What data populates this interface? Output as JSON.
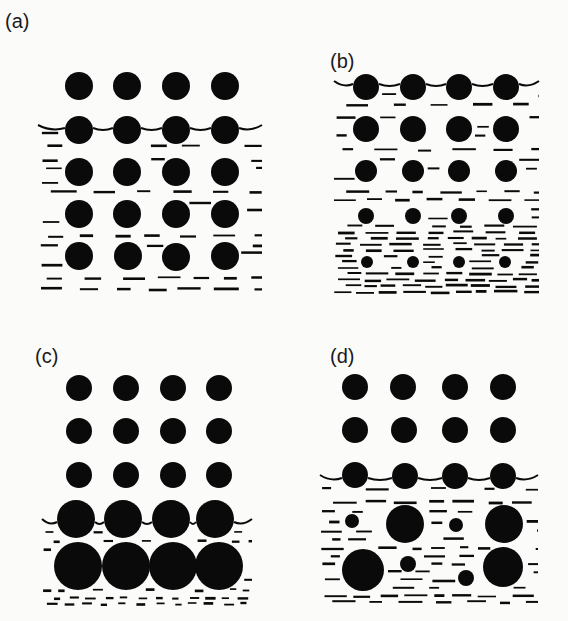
{
  "figure": {
    "width": 568,
    "height": 621,
    "ink_color": "#0a0a0a",
    "background": "#fbfbfa",
    "panels": [
      {
        "id": "a",
        "label": "(a)",
        "label_pos": [
          5,
          28
        ],
        "region": {
          "x0": 38,
          "x1": 262,
          "y_surface": 128,
          "y_bottom": 290
        },
        "dash_rows": [
          132,
          145,
          160,
          168,
          182,
          192,
          203,
          210,
          222,
          236,
          245,
          253,
          266,
          278,
          289
        ],
        "dash_density": "sparse",
        "circles": [
          {
            "cx": 79,
            "cy": 86,
            "r": 14
          },
          {
            "cx": 127,
            "cy": 86,
            "r": 14
          },
          {
            "cx": 176,
            "cy": 86,
            "r": 14
          },
          {
            "cx": 225,
            "cy": 86,
            "r": 14
          },
          {
            "cx": 79,
            "cy": 130,
            "r": 14
          },
          {
            "cx": 127,
            "cy": 130,
            "r": 14
          },
          {
            "cx": 176,
            "cy": 130,
            "r": 14
          },
          {
            "cx": 225,
            "cy": 130,
            "r": 14
          },
          {
            "cx": 79,
            "cy": 172,
            "r": 14
          },
          {
            "cx": 127,
            "cy": 172,
            "r": 14
          },
          {
            "cx": 176,
            "cy": 172,
            "r": 14
          },
          {
            "cx": 225,
            "cy": 172,
            "r": 14
          },
          {
            "cx": 79,
            "cy": 214,
            "r": 14
          },
          {
            "cx": 127,
            "cy": 214,
            "r": 14
          },
          {
            "cx": 176,
            "cy": 214,
            "r": 14
          },
          {
            "cx": 225,
            "cy": 214,
            "r": 14
          },
          {
            "cx": 79,
            "cy": 256,
            "r": 14
          },
          {
            "cx": 128,
            "cy": 256,
            "r": 14
          },
          {
            "cx": 176,
            "cy": 257,
            "r": 14
          },
          {
            "cx": 225,
            "cy": 256,
            "r": 14
          }
        ]
      },
      {
        "id": "b",
        "label": "(b)",
        "label_pos": [
          330,
          68
        ],
        "region": {
          "x0": 334,
          "x1": 539,
          "y_surface": 84,
          "y_bottom": 296
        },
        "dash_rows": [
          95,
          105,
          117,
          126,
          136,
          150,
          160,
          168,
          178,
          192,
          200,
          210,
          218,
          226,
          232,
          238,
          244,
          250,
          256,
          262,
          268,
          274,
          280,
          286,
          292
        ],
        "dash_density": "graded",
        "circles": [
          {
            "cx": 366,
            "cy": 87,
            "r": 13
          },
          {
            "cx": 413,
            "cy": 87,
            "r": 13
          },
          {
            "cx": 459,
            "cy": 87,
            "r": 13
          },
          {
            "cx": 506,
            "cy": 87,
            "r": 13
          },
          {
            "cx": 366,
            "cy": 129,
            "r": 13
          },
          {
            "cx": 413,
            "cy": 129,
            "r": 13
          },
          {
            "cx": 459,
            "cy": 129,
            "r": 13
          },
          {
            "cx": 506,
            "cy": 129,
            "r": 13
          },
          {
            "cx": 366,
            "cy": 171,
            "r": 11
          },
          {
            "cx": 413,
            "cy": 171,
            "r": 11
          },
          {
            "cx": 459,
            "cy": 171,
            "r": 11
          },
          {
            "cx": 506,
            "cy": 171,
            "r": 11
          },
          {
            "cx": 366,
            "cy": 216,
            "r": 8
          },
          {
            "cx": 413,
            "cy": 216,
            "r": 8
          },
          {
            "cx": 459,
            "cy": 216,
            "r": 8
          },
          {
            "cx": 506,
            "cy": 216,
            "r": 8
          },
          {
            "cx": 367,
            "cy": 262,
            "r": 6
          },
          {
            "cx": 413,
            "cy": 262,
            "r": 6
          },
          {
            "cx": 459,
            "cy": 262,
            "r": 6
          },
          {
            "cx": 505,
            "cy": 262,
            "r": 6
          }
        ]
      },
      {
        "id": "c",
        "label": "(c)",
        "label_pos": [
          35,
          363
        ],
        "region": {
          "x0": 42,
          "x1": 252,
          "y_surface": 522,
          "y_bottom": 604
        },
        "dash_rows": [
          532,
          541,
          550,
          560,
          570,
          580,
          590,
          598,
          604
        ],
        "dash_density": "fine",
        "circles": [
          {
            "cx": 79,
            "cy": 388,
            "r": 13
          },
          {
            "cx": 126,
            "cy": 388,
            "r": 13
          },
          {
            "cx": 173,
            "cy": 388,
            "r": 13
          },
          {
            "cx": 219,
            "cy": 388,
            "r": 13
          },
          {
            "cx": 79,
            "cy": 431,
            "r": 13
          },
          {
            "cx": 126,
            "cy": 431,
            "r": 13
          },
          {
            "cx": 173,
            "cy": 431,
            "r": 13
          },
          {
            "cx": 219,
            "cy": 431,
            "r": 13
          },
          {
            "cx": 79,
            "cy": 475,
            "r": 13
          },
          {
            "cx": 126,
            "cy": 475,
            "r": 13
          },
          {
            "cx": 173,
            "cy": 475,
            "r": 13
          },
          {
            "cx": 219,
            "cy": 475,
            "r": 13
          },
          {
            "cx": 76,
            "cy": 519,
            "r": 19
          },
          {
            "cx": 123,
            "cy": 519,
            "r": 19
          },
          {
            "cx": 171,
            "cy": 519,
            "r": 19
          },
          {
            "cx": 215,
            "cy": 519,
            "r": 19
          },
          {
            "cx": 78,
            "cy": 566,
            "r": 24
          },
          {
            "cx": 126,
            "cy": 566,
            "r": 24
          },
          {
            "cx": 173,
            "cy": 566,
            "r": 24
          },
          {
            "cx": 219,
            "cy": 566,
            "r": 24
          }
        ]
      },
      {
        "id": "d",
        "label": "(d)",
        "label_pos": [
          330,
          363
        ],
        "region": {
          "x0": 320,
          "x1": 538,
          "y_surface": 478,
          "y_bottom": 603
        },
        "dash_rows": [
          489,
          502,
          512,
          522,
          531,
          539,
          548,
          556,
          564,
          572,
          580,
          588,
          596,
          602
        ],
        "dash_density": "irregular",
        "circles": [
          {
            "cx": 355,
            "cy": 387,
            "r": 13
          },
          {
            "cx": 403,
            "cy": 387,
            "r": 13
          },
          {
            "cx": 455,
            "cy": 387,
            "r": 13
          },
          {
            "cx": 503,
            "cy": 387,
            "r": 13
          },
          {
            "cx": 355,
            "cy": 430,
            "r": 13
          },
          {
            "cx": 404,
            "cy": 430,
            "r": 13
          },
          {
            "cx": 455,
            "cy": 430,
            "r": 13
          },
          {
            "cx": 503,
            "cy": 430,
            "r": 13
          },
          {
            "cx": 355,
            "cy": 475,
            "r": 13
          },
          {
            "cx": 405,
            "cy": 476,
            "r": 13
          },
          {
            "cx": 455,
            "cy": 476,
            "r": 13
          },
          {
            "cx": 503,
            "cy": 476,
            "r": 13
          },
          {
            "cx": 352,
            "cy": 521,
            "r": 7
          },
          {
            "cx": 405,
            "cy": 524,
            "r": 19
          },
          {
            "cx": 456,
            "cy": 525,
            "r": 7
          },
          {
            "cx": 504,
            "cy": 524,
            "r": 19
          },
          {
            "cx": 363,
            "cy": 570,
            "r": 21
          },
          {
            "cx": 408,
            "cy": 564,
            "r": 8
          },
          {
            "cx": 466,
            "cy": 578,
            "r": 8
          },
          {
            "cx": 503,
            "cy": 567,
            "r": 20
          }
        ]
      }
    ]
  }
}
